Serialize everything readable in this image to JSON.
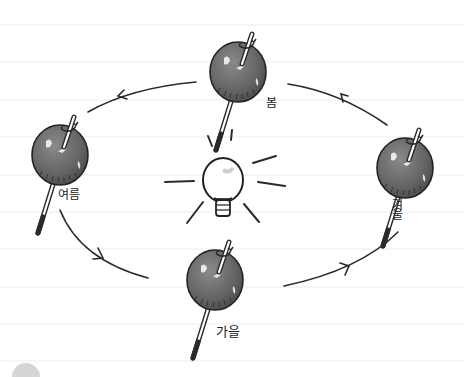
{
  "figure": {
    "colors": {
      "background": "#ffffff",
      "ruled_line": "#ececec",
      "ink": "#2a2a2a",
      "apple_fill": "#6a6a6a",
      "apple_highlight": "#e8e8e8",
      "bulb_fill": "#ffffff"
    }
  },
  "center": {
    "icon": "light-bulb-icon",
    "role": "sun"
  },
  "seasons": [
    {
      "id": "spring",
      "label": "봄",
      "position": "top"
    },
    {
      "id": "summer",
      "label": "여름",
      "position": "left"
    },
    {
      "id": "autumn",
      "label": "가을",
      "position": "bottom"
    },
    {
      "id": "winter",
      "label": "겨울",
      "position": "right"
    }
  ],
  "orbit": {
    "direction": "counter-clockwise",
    "arrows": 4
  }
}
